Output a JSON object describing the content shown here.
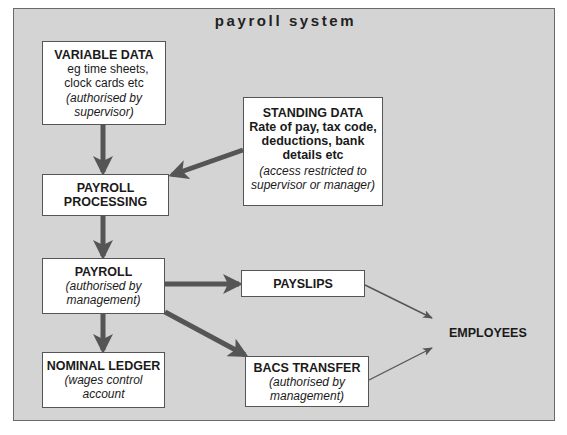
{
  "diagram": {
    "title": "payroll system",
    "colors": {
      "background": "#d4d4d4",
      "box_fill": "#ffffff",
      "thick_arrow": "#555555",
      "thin_arrow": "#555555",
      "text": "#1a1a1a"
    },
    "nodes": {
      "variable_data": {
        "heading": "VARIABLE DATA",
        "line1": "eg time sheets,",
        "line2": "clock cards etc",
        "note1": "(authorised by",
        "note2": "supervisor)"
      },
      "standing_data": {
        "heading": "STANDING DATA",
        "line1": "Rate of pay, tax code,",
        "line2": "deductions, bank",
        "line3": "details etc",
        "note1": "(access restricted to",
        "note2": "supervisor or manager)"
      },
      "payroll_processing": {
        "line1": "PAYROLL",
        "line2": "PROCESSING"
      },
      "payroll": {
        "heading": "PAYROLL",
        "note1": "(authorised by",
        "note2": "management)"
      },
      "nominal_ledger": {
        "heading": "NOMINAL LEDGER",
        "note1": "(wages control",
        "note2": "account"
      },
      "payslips": {
        "heading": "PAYSLIPS"
      },
      "bacs_transfer": {
        "heading": "BACS TRANSFER",
        "note1": "(authorised by",
        "note2": "management)"
      },
      "employees": {
        "label": "EMPLOYEES"
      }
    },
    "edges": [
      {
        "from": "VARIABLE DATA",
        "to": "PAYROLL PROCESSING",
        "style": "thick"
      },
      {
        "from": "STANDING DATA",
        "to": "PAYROLL PROCESSING",
        "style": "thick"
      },
      {
        "from": "PAYROLL PROCESSING",
        "to": "PAYROLL",
        "style": "thick"
      },
      {
        "from": "PAYROLL",
        "to": "PAYSLIPS",
        "style": "thick"
      },
      {
        "from": "PAYROLL",
        "to": "BACS TRANSFER",
        "style": "thick"
      },
      {
        "from": "PAYROLL",
        "to": "NOMINAL LEDGER",
        "style": "thick"
      },
      {
        "from": "PAYSLIPS",
        "to": "EMPLOYEES",
        "style": "thin"
      },
      {
        "from": "BACS TRANSFER",
        "to": "EMPLOYEES",
        "style": "thin"
      }
    ]
  }
}
